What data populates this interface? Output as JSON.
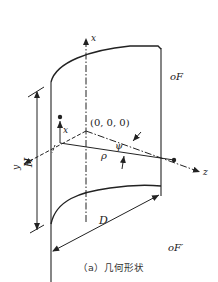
{
  "figure": {
    "caption": "（a）几何形状",
    "labels": {
      "x_axis": "x",
      "y_axis": "y",
      "z_axis": "z",
      "origin": "(0, 0, 0)",
      "height": "H",
      "depth": "D",
      "rho": "ρ",
      "psi": "ψ",
      "local_x": "x",
      "point_f": "oF",
      "point_f_prime": "oF′"
    },
    "colors": {
      "line": "#222222",
      "background": "#ffffff"
    }
  }
}
